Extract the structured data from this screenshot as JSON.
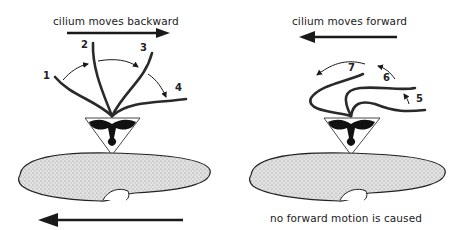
{
  "left_panel": {
    "caption": "cilium moves backward",
    "arrow_direction": "right",
    "cilium_positions": [
      "1",
      "2",
      "3",
      "4"
    ],
    "body_motion_arrow": "left"
  },
  "right_panel": {
    "caption": "cilium moves forward",
    "arrow_direction": "left",
    "cilium_positions": [
      "5",
      "6",
      "7"
    ],
    "bottom_caption": "no forward motion is caused"
  },
  "colors": {
    "ink": "#1a1a1a",
    "body_fill": "#d9d9d9",
    "background": "#ffffff"
  }
}
